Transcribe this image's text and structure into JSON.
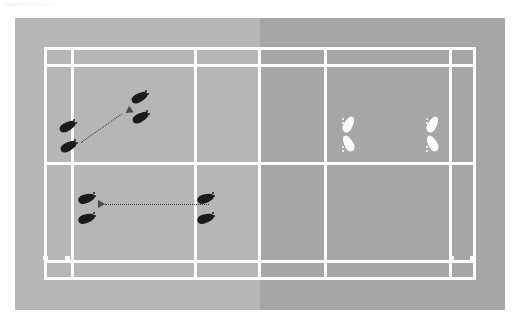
{
  "caption": {
    "text": "badminton court"
  },
  "colors": {
    "court_far_half": "#b6b6b6",
    "court_near_half": "#a6a6a6",
    "court_lines": "#fdfdfd",
    "page_background": "#ffffff",
    "footprint_dark": "#1b1b1b",
    "footprint_light": "#fbfbfb",
    "arrow": "#3a3a3a"
  },
  "diagram": {
    "type": "court-drill-diagram",
    "court": {
      "panel": {
        "x": 15,
        "y": 18,
        "width": 490,
        "height": 292
      },
      "orientation": "horizontal",
      "halves": [
        "far-half-left",
        "near-half-right"
      ],
      "net_position_x_percent": 50
    },
    "lines": [
      {
        "name": "outer-doubles-sideline-top",
        "orientation": "horizontal"
      },
      {
        "name": "singles-sideline-top",
        "orientation": "horizontal"
      },
      {
        "name": "short-service-line-midcourt",
        "orientation": "horizontal"
      },
      {
        "name": "singles-sideline-bottom",
        "orientation": "horizontal"
      },
      {
        "name": "outer-doubles-sideline-bottom",
        "orientation": "horizontal"
      },
      {
        "name": "left-baseline",
        "orientation": "vertical"
      },
      {
        "name": "left-doubles-long-service-line",
        "orientation": "vertical"
      },
      {
        "name": "left-short-service-line",
        "orientation": "vertical"
      },
      {
        "name": "net-line",
        "orientation": "vertical"
      },
      {
        "name": "right-short-service-line",
        "orientation": "vertical"
      },
      {
        "name": "right-doubles-long-service-line",
        "orientation": "vertical"
      },
      {
        "name": "right-baseline",
        "orientation": "vertical"
      }
    ],
    "players": [
      {
        "id": "player-dark-rear",
        "color": "dark",
        "label": "attacking player start",
        "position": {
          "x": 76,
          "y": 127
        },
        "rotation": -32
      },
      {
        "id": "player-dark-front",
        "color": "dark",
        "label": "attacking player target",
        "position": {
          "x": 148,
          "y": 100
        },
        "rotation": -32
      },
      {
        "id": "player-dark-mid-left",
        "color": "dark",
        "label": "second player target",
        "position": {
          "x": 93,
          "y": 198
        },
        "rotation": -18
      },
      {
        "id": "player-dark-mid-right",
        "color": "dark",
        "label": "second player start",
        "position": {
          "x": 212,
          "y": 198
        },
        "rotation": -18
      },
      {
        "id": "player-light-left",
        "color": "light",
        "label": "opponent left",
        "position": {
          "x": 348,
          "y": 128
        },
        "rotation": 0
      },
      {
        "id": "player-light-right",
        "color": "light",
        "label": "opponent right",
        "position": {
          "x": 432,
          "y": 128
        },
        "rotation": 0
      }
    ],
    "movement_arrows": [
      {
        "id": "arrow-diagonal-forward",
        "style": "dotted",
        "from": {
          "x": 96,
          "y": 140
        },
        "to": {
          "x": 140,
          "y": 108
        },
        "direction": "up-right"
      },
      {
        "id": "arrow-horizontal-left",
        "style": "dotted",
        "from": {
          "x": 218,
          "y": 204
        },
        "to": {
          "x": 108,
          "y": 204
        },
        "direction": "left"
      }
    ]
  }
}
